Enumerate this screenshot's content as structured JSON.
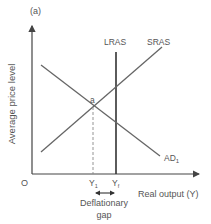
{
  "panel_label": "(a)",
  "axes": {
    "y_label": "Average price level",
    "x_label": "Real output (Y)",
    "origin": "O"
  },
  "curves": {
    "lras": {
      "label": "LRAS",
      "color": "#333333"
    },
    "sras": {
      "label": "SRAS",
      "color": "#666666"
    },
    "ad": {
      "label": "AD",
      "subscript": "1",
      "color": "#666666"
    }
  },
  "points": {
    "equilibrium": "a"
  },
  "x_ticks": {
    "y1": {
      "base": "Y",
      "subscript": "1"
    },
    "yf": {
      "base": "Y",
      "subscript": "f"
    }
  },
  "annotation": {
    "line1": "Deflationary",
    "line2": "gap"
  }
}
